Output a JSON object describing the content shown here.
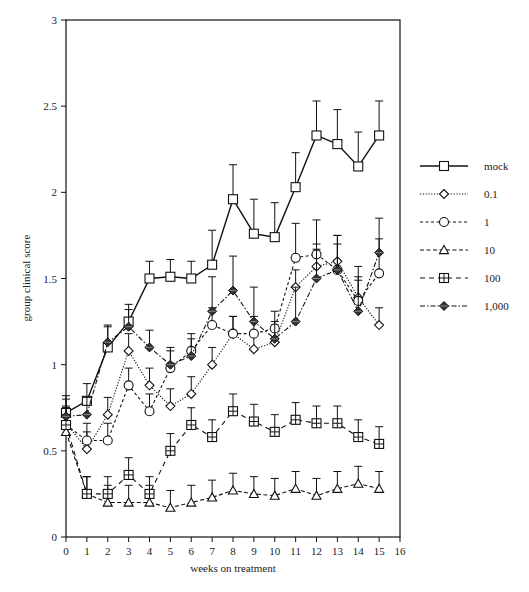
{
  "chart_data": {
    "type": "line",
    "title": "",
    "xlabel": "weeks on treatment",
    "ylabel": "group clinical score",
    "xlim": [
      0,
      16
    ],
    "ylim": [
      0,
      3
    ],
    "x_ticks": [
      0,
      1,
      2,
      3,
      4,
      5,
      6,
      7,
      8,
      9,
      10,
      11,
      12,
      13,
      14,
      15,
      16
    ],
    "y_ticks": [
      0,
      0.5,
      1,
      1.5,
      2,
      2.5,
      3
    ],
    "y_tick_labels": [
      "0",
      "0.5",
      "1",
      "1.5",
      "2",
      "2.5",
      "3"
    ],
    "grid": false,
    "legend_position": "right",
    "x": [
      0,
      1,
      2,
      3,
      4,
      5,
      6,
      7,
      8,
      9,
      10,
      11,
      12,
      13,
      14,
      15
    ],
    "series": [
      {
        "name": "mock",
        "marker": "square",
        "dash": "solid",
        "values": [
          0.72,
          0.79,
          1.1,
          1.25,
          1.5,
          1.51,
          1.5,
          1.58,
          1.96,
          1.76,
          1.74,
          2.03,
          2.33,
          2.28,
          2.15,
          2.33
        ],
        "errors": [
          0.1,
          0.1,
          0.12,
          0.1,
          0.1,
          0.1,
          0.1,
          0.2,
          0.2,
          0.2,
          0.2,
          0.2,
          0.2,
          0.2,
          0.2,
          0.2
        ]
      },
      {
        "name": "0.1",
        "marker": "diamond",
        "dash": "dotted",
        "values": [
          0.66,
          0.51,
          0.71,
          1.08,
          0.88,
          0.76,
          0.83,
          1.0,
          1.18,
          1.09,
          1.13,
          1.45,
          1.57,
          1.6,
          1.39,
          1.23
        ],
        "errors": [
          0.1,
          0.1,
          0.1,
          0.1,
          0.1,
          0.1,
          0.1,
          0.1,
          0.1,
          0.1,
          0.1,
          0.1,
          0.1,
          0.1,
          0.1,
          0.1
        ]
      },
      {
        "name": "1",
        "marker": "circle",
        "dash": "dashed-short",
        "values": [
          0.65,
          0.56,
          0.56,
          0.88,
          0.73,
          0.98,
          1.08,
          1.23,
          1.18,
          1.18,
          1.21,
          1.62,
          1.64,
          1.55,
          1.37,
          1.53
        ],
        "errors": [
          0.1,
          0.1,
          0.1,
          0.1,
          0.1,
          0.1,
          0.1,
          0.1,
          0.1,
          0.1,
          0.1,
          0.2,
          0.2,
          0.2,
          0.2,
          0.2
        ]
      },
      {
        "name": "10",
        "marker": "triangle",
        "dash": "dashed",
        "values": [
          0.61,
          0.25,
          0.2,
          0.2,
          0.2,
          0.17,
          0.2,
          0.23,
          0.27,
          0.25,
          0.24,
          0.28,
          0.24,
          0.28,
          0.31,
          0.28
        ],
        "errors": [
          0.1,
          0.1,
          0.1,
          0.1,
          0.1,
          0.1,
          0.1,
          0.1,
          0.1,
          0.1,
          0.1,
          0.1,
          0.1,
          0.1,
          0.1,
          0.1
        ]
      },
      {
        "name": "100",
        "marker": "square-cross",
        "dash": "dashed-long",
        "values": [
          0.65,
          0.25,
          0.25,
          0.36,
          0.25,
          0.5,
          0.65,
          0.58,
          0.73,
          0.67,
          0.61,
          0.68,
          0.66,
          0.66,
          0.58,
          0.54
        ],
        "errors": [
          0.1,
          0.1,
          0.1,
          0.1,
          0.1,
          0.1,
          0.1,
          0.1,
          0.1,
          0.1,
          0.1,
          0.1,
          0.1,
          0.1,
          0.1,
          0.1
        ]
      },
      {
        "name": "1,000",
        "marker": "filled-diamond",
        "dash": "dash-dot",
        "values": [
          0.7,
          0.71,
          1.13,
          1.22,
          1.1,
          1.0,
          1.05,
          1.31,
          1.43,
          1.25,
          1.15,
          1.25,
          1.5,
          1.55,
          1.31,
          1.65
        ],
        "errors": [
          0.1,
          0.1,
          0.1,
          0.1,
          0.1,
          0.1,
          0.1,
          0.2,
          0.2,
          0.2,
          0.1,
          0.2,
          0.2,
          0.2,
          0.2,
          0.2
        ]
      }
    ]
  },
  "legend": {
    "items": [
      {
        "label": "mock"
      },
      {
        "label": "0.1"
      },
      {
        "label": "1"
      },
      {
        "label": "10"
      },
      {
        "label": "100"
      },
      {
        "label": "1,000"
      }
    ]
  }
}
